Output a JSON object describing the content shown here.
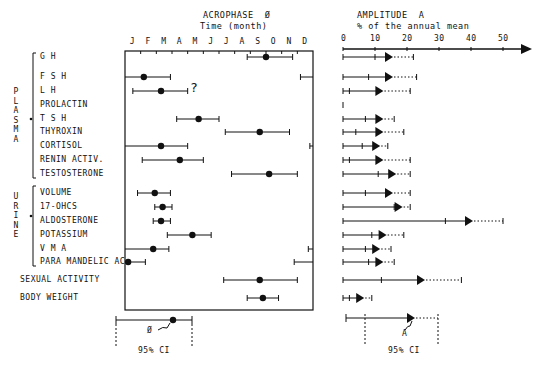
{
  "chart_data": [
    {
      "type": "scatter",
      "title": "ACROPHASE Ø",
      "subtitle": "Time (month)",
      "xlabel": "Time (month)",
      "tick_labels": [
        "J",
        "F",
        "M",
        "A",
        "M",
        "J",
        "J",
        "A",
        "S",
        "O",
        "N",
        "D"
      ],
      "grid": false,
      "groups": [
        {
          "name": "PLASMA",
          "rows": [
            "G H",
            "F S H",
            "L H",
            "PROLACTIN",
            "T S H",
            "THYROXIN",
            "CORTISOL",
            "RENIN ACTIV.",
            "TESTOSTERONE"
          ]
        },
        {
          "name": "URINE",
          "rows": [
            "VOLUME",
            "17-OHCS",
            "ALDOSTERONE",
            "POTASSIUM",
            "V M A",
            "PARA MANDELIC AC"
          ]
        }
      ],
      "series": [
        {
          "name": "G H",
          "acrophase_month": 9.0,
          "ci": [
            7.8,
            10.7
          ]
        },
        {
          "name": "F S H",
          "acrophase_month": 1.2,
          "ci": [
            -0.8,
            2.9
          ]
        },
        {
          "name": "L H",
          "acrophase_month": 2.3,
          "ci": [
            0.5,
            4.0
          ]
        },
        {
          "name": "PROLACTIN",
          "acrophase_month": null,
          "note": "?"
        },
        {
          "name": "T S H",
          "acrophase_month": 4.7,
          "ci": [
            3.3,
            6.0
          ]
        },
        {
          "name": "THYROXIN",
          "acrophase_month": 8.6,
          "ci": [
            6.4,
            10.5
          ]
        },
        {
          "name": "CORTISOL",
          "acrophase_month": 2.3,
          "ci": [
            -0.2,
            4.0
          ]
        },
        {
          "name": "RENIN ACTIV.",
          "acrophase_month": 3.5,
          "ci": [
            1.1,
            5.0
          ]
        },
        {
          "name": "TESTOSTERONE",
          "acrophase_month": 9.2,
          "ci": [
            6.8,
            11.0
          ]
        },
        {
          "name": "VOLUME",
          "acrophase_month": 1.9,
          "ci": [
            0.8,
            2.9
          ]
        },
        {
          "name": "17-OHCS",
          "acrophase_month": 2.4,
          "ci": [
            1.9,
            3.0
          ]
        },
        {
          "name": "ALDOSTERONE",
          "acrophase_month": 2.3,
          "ci": [
            1.8,
            2.9
          ]
        },
        {
          "name": "POTASSIUM",
          "acrophase_month": 4.3,
          "ci": [
            2.7,
            5.5
          ]
        },
        {
          "name": "V M A",
          "acrophase_month": 1.8,
          "ci": [
            -0.3,
            2.8
          ]
        },
        {
          "name": "PARA MANDELIC AC",
          "acrophase_month": 0.2,
          "ci": [
            -1.2,
            1.3
          ]
        },
        {
          "name": "SEXUAL ACTIVITY",
          "acrophase_month": 8.6,
          "ci": [
            6.3,
            11.0
          ]
        },
        {
          "name": "BODY WEIGHT",
          "acrophase_month": 8.8,
          "ci": [
            7.8,
            9.8
          ]
        }
      ],
      "legend_example": {
        "symbol": "Ø",
        "caption": "95% CI"
      }
    },
    {
      "type": "bar",
      "title": "AMPLITUDE A",
      "subtitle": "% of the annual mean",
      "xlabel": "% of the annual mean",
      "tick_labels": [
        "0",
        "10",
        "20",
        "30",
        "40",
        "50"
      ],
      "xlim": [
        0,
        56
      ],
      "series": [
        {
          "name": "G H",
          "amplitude": 15,
          "ci": [
            10,
            22
          ]
        },
        {
          "name": "F S H",
          "amplitude": 15,
          "ci": [
            8,
            23
          ]
        },
        {
          "name": "L H",
          "amplitude": 12,
          "ci": [
            2,
            21
          ]
        },
        {
          "name": "PROLACTIN",
          "amplitude": 0,
          "ci": [
            0,
            0
          ]
        },
        {
          "name": "T S H",
          "amplitude": 12,
          "ci": [
            7,
            16
          ]
        },
        {
          "name": "THYROXIN",
          "amplitude": 12,
          "ci": [
            4,
            19
          ]
        },
        {
          "name": "CORTISOL",
          "amplitude": 11,
          "ci": [
            6,
            14
          ]
        },
        {
          "name": "RENIN ACTIV.",
          "amplitude": 12,
          "ci": [
            2,
            21
          ]
        },
        {
          "name": "TESTOSTERONE",
          "amplitude": 16,
          "ci": [
            11,
            21
          ]
        },
        {
          "name": "VOLUME",
          "amplitude": 15,
          "ci": [
            7,
            21
          ]
        },
        {
          "name": "17-OHCS",
          "amplitude": 18,
          "ci": [
            16,
            21
          ]
        },
        {
          "name": "ALDOSTERONE",
          "amplitude": 40,
          "ci": [
            32,
            50
          ]
        },
        {
          "name": "POTASSIUM",
          "amplitude": 13,
          "ci": [
            9,
            19
          ]
        },
        {
          "name": "V M A",
          "amplitude": 11,
          "ci": [
            7,
            15
          ]
        },
        {
          "name": "PARA MANDELIC AC",
          "amplitude": 12,
          "ci": [
            8,
            16
          ]
        },
        {
          "name": "SEXUAL ACTIVITY",
          "amplitude": 25,
          "ci": [
            12,
            37
          ]
        },
        {
          "name": "BODY WEIGHT",
          "amplitude": 6,
          "ci": [
            2,
            9
          ]
        }
      ],
      "legend_example": {
        "symbol": "A",
        "caption": "95% CI"
      }
    }
  ],
  "headers": {
    "acrophase_title": "ACROPHASE  Ø",
    "acrophase_sub": "Time (month)",
    "amplitude_title": "AMPLITUDE  A",
    "amplitude_sub": "% of the annual mean"
  },
  "months": [
    "J",
    "F",
    "M",
    "A",
    "M",
    "J",
    "J",
    "A",
    "S",
    "O",
    "N",
    "D"
  ],
  "amp_ticks": [
    "0",
    "10",
    "20",
    "30",
    "40",
    "50"
  ],
  "groups": {
    "plasma": "P\nL\nA\nS\nM\nA",
    "urine": "U\nR\nI\nN\nE"
  },
  "rows": [
    "G H",
    "F S H",
    "L H",
    "PROLACTIN",
    "T S H",
    "THYROXIN",
    "CORTISOL",
    "RENIN ACTIV.",
    "TESTOSTERONE",
    "VOLUME",
    "17-OHCS",
    "ALDOSTERONE",
    "POTASSIUM",
    "V M A",
    "PARA MANDELIC AC",
    "SEXUAL ACTIVITY",
    "BODY WEIGHT"
  ],
  "annotations": {
    "question": "?",
    "phi": "Ø",
    "a": "A",
    "ci_left": "95% CI",
    "ci_right": "95% CI"
  }
}
